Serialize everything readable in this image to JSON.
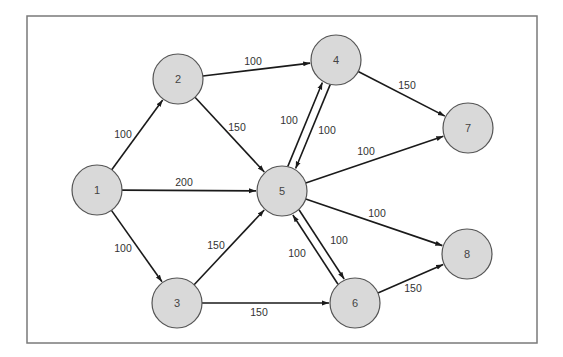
{
  "diagram": {
    "type": "directed-network-graph",
    "frame": {
      "x": 27,
      "y": 16,
      "width": 510,
      "height": 327
    },
    "node_fill": "#d9d9d9",
    "node_stroke": "#555555",
    "edge_color": "#1a1a1a",
    "node_radius": 25,
    "nodes": [
      {
        "id": "1",
        "label": "1",
        "x": 97,
        "y": 190
      },
      {
        "id": "2",
        "label": "2",
        "x": 178,
        "y": 79
      },
      {
        "id": "3",
        "label": "3",
        "x": 177,
        "y": 303
      },
      {
        "id": "4",
        "label": "4",
        "x": 336,
        "y": 60
      },
      {
        "id": "5",
        "label": "5",
        "x": 282,
        "y": 191
      },
      {
        "id": "6",
        "label": "6",
        "x": 355,
        "y": 303
      },
      {
        "id": "7",
        "label": "7",
        "x": 468,
        "y": 128
      },
      {
        "id": "8",
        "label": "8",
        "x": 467,
        "y": 254
      }
    ],
    "edges": [
      {
        "from": "1",
        "to": "2",
        "label": "100",
        "lx": 123,
        "ly": 134,
        "offset": 0
      },
      {
        "from": "1",
        "to": "5",
        "label": "200",
        "lx": 184,
        "ly": 182,
        "offset": 0
      },
      {
        "from": "1",
        "to": "3",
        "label": "100",
        "lx": 123,
        "ly": 248,
        "offset": 0
      },
      {
        "from": "2",
        "to": "4",
        "label": "100",
        "lx": 253,
        "ly": 61,
        "offset": 0
      },
      {
        "from": "2",
        "to": "5",
        "label": "150",
        "lx": 237,
        "ly": 127,
        "offset": 0
      },
      {
        "from": "3",
        "to": "5",
        "label": "150",
        "lx": 216,
        "ly": 245,
        "offset": 0
      },
      {
        "from": "3",
        "to": "6",
        "label": "150",
        "lx": 259,
        "ly": 312,
        "offset": 0
      },
      {
        "from": "4",
        "to": "5",
        "label": "100",
        "lx": 289,
        "ly": 120,
        "offset": -4
      },
      {
        "from": "5",
        "to": "4",
        "label": "100",
        "lx": 327,
        "ly": 130,
        "offset": -4
      },
      {
        "from": "4",
        "to": "7",
        "label": "150",
        "lx": 407,
        "ly": 85,
        "offset": 0
      },
      {
        "from": "5",
        "to": "7",
        "label": "100",
        "lx": 366,
        "ly": 151,
        "offset": 0
      },
      {
        "from": "5",
        "to": "8",
        "label": "100",
        "lx": 377,
        "ly": 213,
        "offset": 0
      },
      {
        "from": "5",
        "to": "6",
        "label": "100",
        "lx": 297,
        "ly": 253,
        "offset": -4
      },
      {
        "from": "6",
        "to": "5",
        "label": "100",
        "lx": 339,
        "ly": 240,
        "offset": -4
      },
      {
        "from": "6",
        "to": "8",
        "label": "150",
        "lx": 413,
        "ly": 288,
        "offset": 0
      }
    ]
  }
}
